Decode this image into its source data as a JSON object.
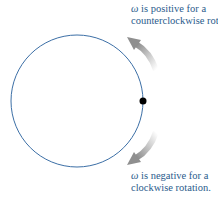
{
  "diagram": {
    "circle": {
      "cx": 77,
      "cy": 101,
      "r": 66,
      "stroke": "#3c6fa6"
    },
    "point": {
      "cx": 143,
      "cy": 101,
      "r": 3.5,
      "fill": "#000000"
    },
    "arrow_color": "#999999",
    "labels": {
      "top": {
        "symbol": "ω",
        "line1_rest": " is positive for a",
        "line2": "counterclockwise rotation."
      },
      "bottom": {
        "symbol": "ω",
        "line1_rest": " is negative for a",
        "line2": "clockwise rotation."
      }
    },
    "text_color": "#2a5b8c"
  }
}
